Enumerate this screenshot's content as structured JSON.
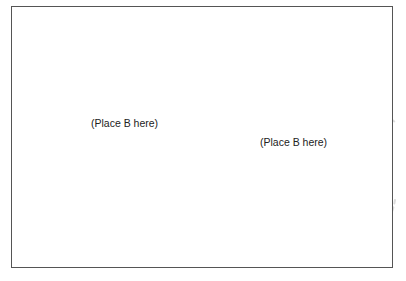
{
  "diagram": {
    "labels": [
      {
        "text": "(Place B here)",
        "x": 91,
        "y": 118
      },
      {
        "text": "(Place B here)",
        "x": 260,
        "y": 137
      }
    ],
    "colors": {
      "border": "#555555",
      "dashed_curves": "#dddddd",
      "text": "#222222"
    }
  }
}
